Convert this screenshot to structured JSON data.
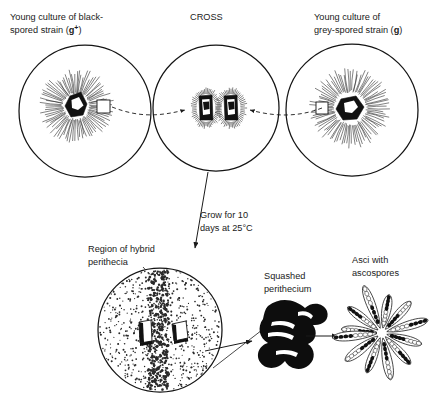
{
  "figure": {
    "background_color": "#ffffff",
    "ink_color": "#1a1a1a"
  },
  "labels": {
    "left_culture": {
      "line1": "Young culture of black-",
      "line2_prefix": "spored strain (",
      "line2_allele": "g",
      "line2_superscript": "+",
      "line2_suffix": ")"
    },
    "cross": "CROSS",
    "right_culture": {
      "line1": "Young culture of",
      "line2_prefix": "grey-spored strain (",
      "line2_allele": "g",
      "line2_suffix": ")"
    },
    "incubation": {
      "line1": "Grow for 10",
      "line2": "days at 25°C"
    },
    "hybrid_region": {
      "line1": "Region of hybrid",
      "line2": "perithecia"
    },
    "squashed": {
      "line1": "Squashed",
      "line2": "perithecium"
    },
    "asci": {
      "line1": "Asci with",
      "line2": "ascospores"
    }
  },
  "icons": {
    "left_dish": "petri-dish-icon",
    "center_dish": "petri-dish-icon",
    "right_dish": "petri-dish-icon",
    "bottom_dish": "petri-dish-icon",
    "inoculum_block": "agar-block-icon",
    "mycelium": "radiating-mycelium-icon",
    "squashed_blob": "squashed-perithecium-icon",
    "ascus_rosette": "ascus-rosette-icon",
    "transfer_arrow": "dashed-arrow-icon",
    "process_arrow": "solid-arrow-icon"
  },
  "dishes": {
    "left": {
      "cx": 85,
      "cy": 111,
      "r": 66
    },
    "center": {
      "cx": 216,
      "cy": 108,
      "r": 63
    },
    "right": {
      "cx": 352,
      "cy": 110,
      "r": 66
    },
    "bottom": {
      "cx": 160,
      "cy": 330,
      "r": 62
    }
  },
  "chart_data": {
    "type": "diagram",
    "steps": [
      {
        "id": "left-culture",
        "label": "Young culture of black-spored strain (g+)",
        "phenotype": "black-spored",
        "genotype": "g+"
      },
      {
        "id": "cross",
        "label": "CROSS",
        "inputs": [
          "left-culture",
          "right-culture"
        ],
        "contents": "two inoculum blocks placed together"
      },
      {
        "id": "right-culture",
        "label": "Young culture of grey-spored strain (g)",
        "phenotype": "grey-spored",
        "genotype": "g"
      },
      {
        "id": "incubation",
        "label": "Grow for 10 days at 25°C",
        "duration_days": 10,
        "temperature_c": 25
      },
      {
        "id": "hybrid-plate",
        "label": "Region of hybrid perithecia",
        "description": "dense stippled band between the two blocks"
      },
      {
        "id": "squashed",
        "label": "Squashed perithecium"
      },
      {
        "id": "asci",
        "label": "Asci with ascospores",
        "ascus_count": 12,
        "spores_per_ascus": 8,
        "spore_colors": [
          "black",
          "white"
        ]
      }
    ]
  }
}
